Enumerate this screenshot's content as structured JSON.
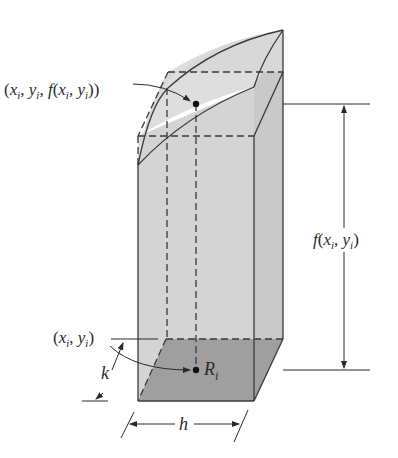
{
  "figure": {
    "type": "3d-prism-volume-approximation",
    "colors": {
      "background": "#ffffff",
      "side_face": "#d3d3d3",
      "right_face": "#c8c8c8",
      "top_surface": "#dcdcdc",
      "base": "#9e9e9e",
      "stroke": "#3a3a3a"
    }
  },
  "labels": {
    "surface_point": {
      "open": "(",
      "x": "x",
      "xsub": "i",
      "comma1": ", ",
      "y": "y",
      "ysub": "i",
      "comma2": ", ",
      "f": "f",
      "open2": "(",
      "x2": "x",
      "x2sub": "i",
      "comma3": ", ",
      "y2": "y",
      "y2sub": "i",
      "close": "))"
    },
    "height": {
      "f": "f",
      "open": "(",
      "x": "x",
      "xsub": "i",
      "comma": ", ",
      "y": "y",
      "ysub": "i",
      "close": ")"
    },
    "base_point": {
      "open": "(",
      "x": "x",
      "xsub": "i",
      "comma": ", ",
      "y": "y",
      "ysub": "i",
      "close": ")"
    },
    "region": {
      "R": "R",
      "sub": "i"
    },
    "depth": "k",
    "width": "h"
  }
}
